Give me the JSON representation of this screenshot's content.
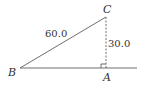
{
  "diagram": {
    "type": "right-triangle",
    "vertices": {
      "A": {
        "label": "A",
        "x": 106,
        "y": 68
      },
      "B": {
        "label": "B",
        "x": 20,
        "y": 68
      },
      "C": {
        "label": "C",
        "x": 106,
        "y": 17
      }
    },
    "sides": {
      "hypotenuse_BC": {
        "label": "60.0"
      },
      "height_CA": {
        "label": "30.0",
        "style": "dashed"
      }
    },
    "right_angle_at": "A",
    "colors": {
      "line": "#666666",
      "text": "#333333"
    }
  }
}
